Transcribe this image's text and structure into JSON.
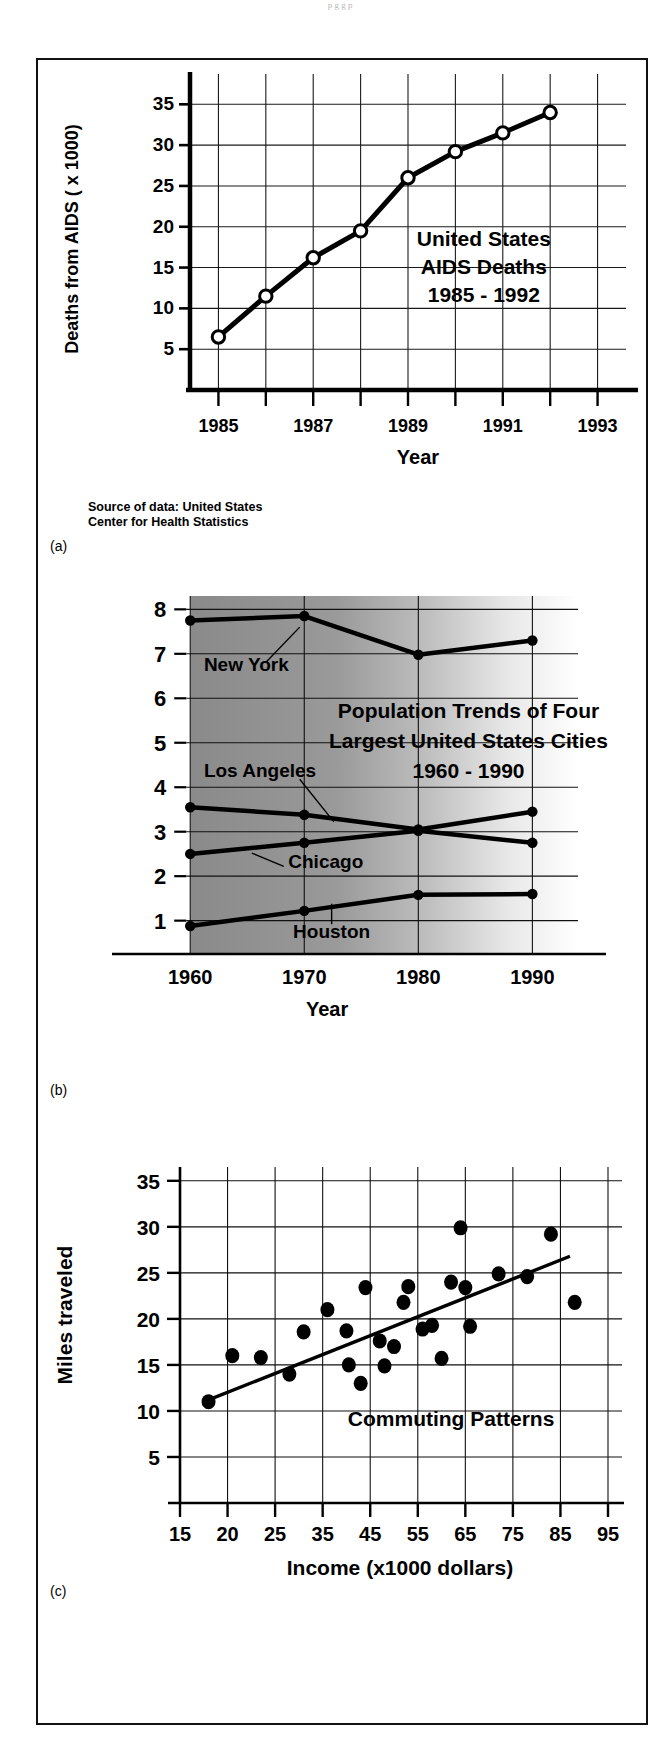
{
  "page": {
    "top_note": "p g     g  p"
  },
  "panels": [
    {
      "tag": "(a)",
      "chart_data": {
        "type": "line",
        "title": "United States\nAIDS Deaths\n1985 - 1992",
        "title_lines": [
          "United States",
          "AIDS Deaths",
          "1985 - 1992"
        ],
        "xlabel": "Year",
        "ylabel": "Deaths from AIDS  ( x 1000)",
        "x": [
          1985,
          1986,
          1987,
          1988,
          1989,
          1990,
          1991,
          1992
        ],
        "values": [
          6.5,
          11.5,
          16.2,
          19.5,
          26.0,
          29.2,
          31.5,
          34.0
        ],
        "xticks": [
          1985,
          1986,
          1987,
          1988,
          1989,
          1990,
          1991,
          1992,
          1993
        ],
        "xtick_labels": [
          "1985",
          "",
          "1987",
          "",
          "1989",
          "",
          "1991",
          "",
          "1993"
        ],
        "yticks": [
          5,
          10,
          15,
          20,
          25,
          30,
          35
        ],
        "ytick_labels": [
          "5",
          "10",
          "15",
          "20",
          "25",
          "30",
          "35"
        ],
        "xlim": [
          1984.4,
          1993.6
        ],
        "ylim": [
          0,
          37
        ],
        "grid": true,
        "marker": "open-circle",
        "legend": "none"
      },
      "source_note": "Source of data: United States\nCenter for Health Statistics"
    },
    {
      "tag": "(b)",
      "chart_data": {
        "type": "line",
        "title": "Population Trends of Four\nLargest United States Cities\n1960 - 1990",
        "title_lines": [
          "Population Trends of Four",
          "Largest United States Cities",
          "1960 - 1990"
        ],
        "xlabel": "Year",
        "ylabel": "",
        "categories": [
          1960,
          1970,
          1980,
          1990
        ],
        "xtick_labels": [
          "1960",
          "1970",
          "1980",
          "1990"
        ],
        "yticks": [
          1,
          2,
          3,
          4,
          5,
          6,
          7,
          8
        ],
        "ytick_labels": [
          "1",
          "2",
          "3",
          "4",
          "5",
          "6",
          "7",
          "8"
        ],
        "ylim": [
          0.25,
          8.3
        ],
        "xlim": [
          1957,
          1994
        ],
        "grid": true,
        "marker": "filled-circle",
        "legend": "inline-annotations",
        "series": [
          {
            "name": "New York",
            "values": [
              7.75,
              7.85,
              6.98,
              7.3
            ]
          },
          {
            "name": "Los Angeles",
            "values": [
              3.55,
              3.38,
              3.05,
              3.45
            ]
          },
          {
            "name": "Chicago",
            "values": [
              2.5,
              2.75,
              3.02,
              2.75
            ]
          },
          {
            "name": "Houston",
            "values": [
              0.88,
              1.22,
              1.58,
              1.6
            ]
          }
        ],
        "background": "gray-gradient-left-to-right"
      }
    },
    {
      "tag": "(c)",
      "chart_data": {
        "type": "scatter",
        "title": "Commuting Patterns",
        "xlabel": "Income (x1000 dollars)",
        "ylabel": "Miles traveled",
        "xticks": [
          15,
          20,
          25,
          35,
          45,
          55,
          65,
          75,
          85,
          95
        ],
        "xtick_labels": [
          "15",
          "20",
          "25",
          "35",
          "45",
          "55",
          "65",
          "75",
          "85",
          "95"
        ],
        "yticks": [
          5,
          10,
          15,
          20,
          25,
          30,
          35
        ],
        "ytick_labels": [
          "5",
          "10",
          "15",
          "20",
          "25",
          "30",
          "35"
        ],
        "ylim": [
          0,
          36.5
        ],
        "grid": true,
        "marker": "filled-circle",
        "legend": "none",
        "points": [
          {
            "x": 18,
            "y": 11.0
          },
          {
            "x": 20.5,
            "y": 16.0
          },
          {
            "x": 23.5,
            "y": 15.8
          },
          {
            "x": 28,
            "y": 14.0
          },
          {
            "x": 31,
            "y": 18.6
          },
          {
            "x": 36,
            "y": 21.0
          },
          {
            "x": 40,
            "y": 18.7
          },
          {
            "x": 40.5,
            "y": 15.0
          },
          {
            "x": 43,
            "y": 13.0
          },
          {
            "x": 44,
            "y": 23.4
          },
          {
            "x": 47,
            "y": 17.6
          },
          {
            "x": 48,
            "y": 14.9
          },
          {
            "x": 50,
            "y": 17.0
          },
          {
            "x": 52,
            "y": 21.8
          },
          {
            "x": 53,
            "y": 23.5
          },
          {
            "x": 56,
            "y": 18.9
          },
          {
            "x": 58,
            "y": 19.3
          },
          {
            "x": 60,
            "y": 15.7
          },
          {
            "x": 62,
            "y": 24.0
          },
          {
            "x": 64,
            "y": 29.9
          },
          {
            "x": 65,
            "y": 23.4
          },
          {
            "x": 66,
            "y": 19.2
          },
          {
            "x": 72,
            "y": 24.9
          },
          {
            "x": 78,
            "y": 24.6
          },
          {
            "x": 83,
            "y": 29.2
          },
          {
            "x": 88,
            "y": 21.8
          }
        ],
        "trendline": {
          "x0": 18,
          "y0": 11.2,
          "x1": 87,
          "y1": 26.8
        }
      }
    }
  ]
}
